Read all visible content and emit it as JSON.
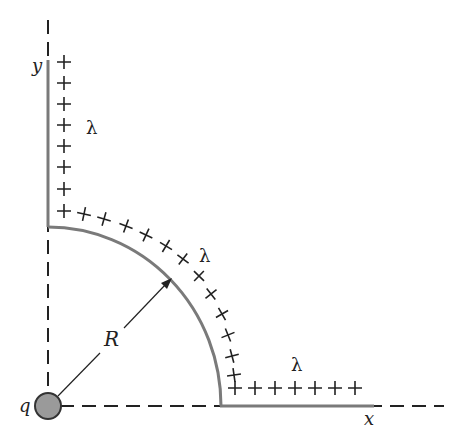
{
  "diagram": {
    "title": "",
    "labels": {
      "y_axis": "y",
      "x_axis": "x",
      "radius": "R",
      "charge": "q",
      "lambda_vertical": "λ",
      "lambda_arc": "λ",
      "lambda_horizontal": "λ"
    },
    "plus_symbol": "+",
    "colors": {
      "rod": "#7a7a7a",
      "axis": "#222222",
      "charge_fill": "#9a9a9a",
      "charge_stroke": "#333333"
    },
    "elements": [
      "vertical charged rod along y-axis (8 plus signs)",
      "quarter-circle charged arc of radius R (12 plus signs)",
      "horizontal charged rod along x-axis (7 plus signs)",
      "point charge q at origin",
      "radius arrow R from q to arc",
      "dashed x and y axes"
    ]
  }
}
